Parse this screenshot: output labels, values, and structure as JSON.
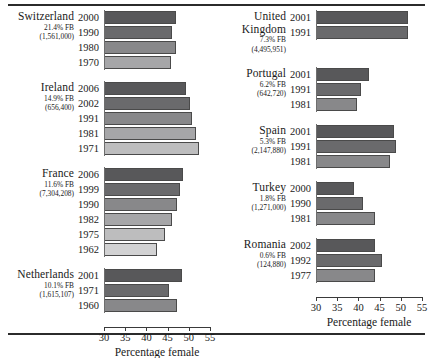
{
  "chart_data": {
    "type": "bar",
    "title": "",
    "xlabel": "Percentage female",
    "ylabel": "",
    "xlim": [
      30,
      55
    ],
    "ticks": [
      30,
      35,
      40,
      45,
      50,
      55
    ],
    "grid": false,
    "legend": null,
    "orientation": "horizontal",
    "note": "Two side-by-side panels; each country group shows percentage female among foreign-born by census year.",
    "panels": [
      {
        "id": "left",
        "xlabel": "Percentage female",
        "groups": [
          {
            "country": "Switzerland",
            "fb_percent": "21.4% FB",
            "fb_count": "(1,561,000)",
            "categories": [
              "2000",
              "1990",
              "1980",
              "1970"
            ],
            "values": [
              46.9,
              46.0,
              47.0,
              45.9
            ]
          },
          {
            "country": "Ireland",
            "fb_percent": "14.9% FB",
            "fb_count": "(656,400)",
            "categories": [
              "2006",
              "2002",
              "1991",
              "1981",
              "1971"
            ],
            "values": [
              49.4,
              50.2,
              50.8,
              51.6,
              52.4
            ]
          },
          {
            "country": "France",
            "fb_percent": "11.6% FB",
            "fb_count": "(7,304,208)",
            "categories": [
              "2006",
              "1999",
              "1990",
              "1982",
              "1975",
              "1962"
            ],
            "values": [
              48.6,
              48.0,
              47.2,
              46.0,
              44.4,
              42.6
            ]
          },
          {
            "country": "Netherlands",
            "fb_percent": "10.1% FB",
            "fb_count": "(1,615,107)",
            "categories": [
              "2001",
              "1971",
              "1960"
            ],
            "values": [
              48.3,
              45.4,
              47.3
            ]
          }
        ]
      },
      {
        "id": "right",
        "xlabel": "Percentage female",
        "groups": [
          {
            "country": "United\nKingdom",
            "fb_percent": "7.3% FB",
            "fb_count": "(4,495,951)",
            "categories": [
              "2001",
              "1991"
            ],
            "values": [
              51.8,
              51.6
            ]
          },
          {
            "country": "Portugal",
            "fb_percent": "6.2% FB",
            "fb_count": "(642,720)",
            "categories": [
              "2001",
              "1991",
              "1981"
            ],
            "values": [
              42.6,
              40.6,
              39.6
            ]
          },
          {
            "country": "Spain",
            "fb_percent": "5.3% FB",
            "fb_count": "(2,147,880)",
            "categories": [
              "2001",
              "1991",
              "1981"
            ],
            "values": [
              48.5,
              48.9,
              47.5
            ]
          },
          {
            "country": "Turkey",
            "fb_percent": "1.8% FB",
            "fb_count": "(1,271,000)",
            "categories": [
              "2000",
              "1990",
              "1981"
            ],
            "values": [
              39.0,
              41.0,
              44.0
            ]
          },
          {
            "country": "Romania",
            "fb_percent": "0.6% FB",
            "fb_count": "(124,880)",
            "categories": [
              "2002",
              "1992",
              "1977"
            ],
            "values": [
              44.0,
              45.6,
              44.0
            ]
          }
        ]
      }
    ]
  },
  "style": {
    "bar_shades": [
      "#58585a",
      "#6a6a6c",
      "#88888a",
      "#a6a6a8",
      "#bdbdbe",
      "#d2d2d3"
    ],
    "bar_border": "#4a4a4a",
    "axis_color": "#3a3a3a",
    "rule_color": "#2b2b2b"
  }
}
